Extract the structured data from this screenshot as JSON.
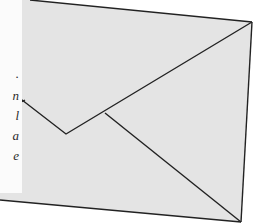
{
  "illustration": {
    "subject": "envelope",
    "colors": {
      "envelope_fill": "#e4e4e4",
      "outline": "#222222",
      "paper": "#fbfbfb",
      "background": "#ffffff",
      "text": "#2a2a2a"
    },
    "paper_text_fragments": [
      ".",
      "n",
      "l",
      "a",
      "e"
    ]
  }
}
